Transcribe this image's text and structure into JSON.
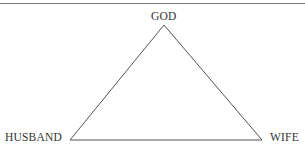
{
  "diagram": {
    "type": "triangle",
    "nodes": [
      {
        "id": "god",
        "label": "GOD",
        "position": "apex"
      },
      {
        "id": "husband",
        "label": "HUSBAND",
        "position": "bottom-left"
      },
      {
        "id": "wife",
        "label": "WIFE",
        "position": "bottom-right"
      }
    ],
    "edges": [
      {
        "from": "god",
        "to": "husband"
      },
      {
        "from": "god",
        "to": "wife"
      },
      {
        "from": "husband",
        "to": "wife"
      }
    ],
    "colors": {
      "line": "#555555",
      "text": "#333333",
      "rule": "#7a7a7a"
    }
  }
}
